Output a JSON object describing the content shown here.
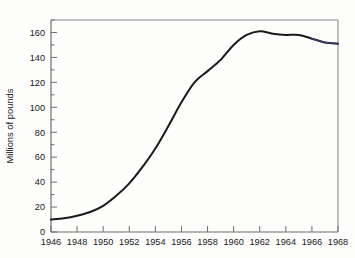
{
  "chart_data": {
    "type": "line",
    "title": "",
    "xlabel": "",
    "ylabel": "Millions of pounds",
    "xlim": [
      1946,
      1968
    ],
    "ylim": [
      0,
      170
    ],
    "grid": false,
    "legend": null,
    "x_ticks": [
      1946,
      1948,
      1950,
      1952,
      1954,
      1956,
      1958,
      1960,
      1962,
      1964,
      1966,
      1968
    ],
    "x_ticklabels": [
      "1946",
      "1948",
      "1950",
      "1952",
      "1954",
      "1956",
      "1958",
      "1960",
      "1962",
      "1964",
      "1966",
      "1968"
    ],
    "y_ticks": [
      0,
      20,
      40,
      60,
      80,
      100,
      120,
      140,
      160
    ],
    "y_ticklabels": [
      "0",
      "20",
      "40",
      "60",
      "80",
      "100",
      "120",
      "140",
      "160"
    ],
    "y_minor_ticks": [
      10,
      30,
      50,
      70,
      90,
      110,
      130,
      150,
      170
    ],
    "line_color": "#1a1a1a",
    "tail_color": "#3a3f7a",
    "series": [
      {
        "name": "Millions of pounds",
        "x": [
          1946,
          1947,
          1948,
          1949,
          1950,
          1951,
          1952,
          1953,
          1954,
          1955,
          1956,
          1957,
          1958,
          1959,
          1960,
          1961,
          1962,
          1963,
          1964,
          1965,
          1966,
          1967,
          1968
        ],
        "values": [
          10,
          11,
          13,
          16,
          21,
          29,
          39,
          52,
          67,
          85,
          104,
          120,
          129,
          138,
          150,
          158,
          161,
          159,
          158,
          158,
          155,
          152,
          151
        ]
      }
    ]
  },
  "axis": {
    "y_title": "Millions of pounds"
  }
}
